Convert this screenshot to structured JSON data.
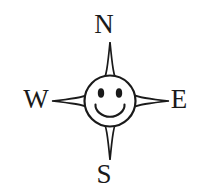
{
  "figure": {
    "background_color": "#ffffff",
    "ink_color": "#1a1a1a",
    "width": 206,
    "height": 194
  },
  "labels": {
    "north": "N",
    "south": "S",
    "west": "W",
    "east": "E"
  },
  "compass": {
    "center_x": 110,
    "center_y": 101,
    "face_radius": 26,
    "outline_color": "#1a1a1a",
    "fill_color": "#ffffff",
    "points": [
      {
        "name": "north",
        "tip_x": 110,
        "tip_y": 42
      },
      {
        "name": "east",
        "tip_x": 169,
        "tip_y": 101
      },
      {
        "name": "south",
        "tip_x": 110,
        "tip_y": 160
      },
      {
        "name": "west",
        "tip_x": 52,
        "tip_y": 101
      }
    ]
  },
  "face": {
    "left_eye": {
      "cx": 101,
      "cy": 93,
      "rx": 3.2,
      "ry": 4.6
    },
    "right_eye": {
      "cx": 119,
      "cy": 93,
      "rx": 3.2,
      "ry": 4.6
    },
    "mouth_description": "upturned smile arc with small ticks at both ends"
  }
}
